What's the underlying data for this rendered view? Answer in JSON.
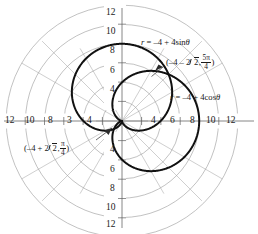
{
  "figure": {
    "kind": "polar-plot",
    "center_px": [
      122,
      121
    ],
    "px_per_unit": 9.65,
    "background": "#ffffff",
    "grid_color": "#9a9a9a",
    "axis_color": "#6e6e6e",
    "curve_color": "#111111"
  },
  "chart_data": {
    "type": "line",
    "plot_system": "polar",
    "title": "",
    "subtitle": "",
    "xlabel": "",
    "ylabel": "",
    "grid": true,
    "legend_position": "inline-annotations",
    "polar_grid": {
      "radial_circles": [
        2,
        4,
        6,
        8,
        10,
        12
      ],
      "spoke_angles_deg": [
        0,
        30,
        45,
        60,
        90,
        120,
        135,
        150,
        180,
        210,
        225,
        240,
        270,
        300,
        315,
        330
      ],
      "rmax": 12
    },
    "axis_ticks": {
      "left": [
        "12",
        "10",
        "8",
        "3",
        "4"
      ],
      "right": [
        "4",
        "6",
        "8",
        "10",
        "12"
      ],
      "top": [
        "12",
        "10",
        "8",
        "6",
        "4"
      ],
      "bottom": [
        "4",
        "6",
        "8",
        "10",
        "12"
      ],
      "left_values": [
        -12,
        -10,
        -8,
        -6,
        -4
      ],
      "right_values": [
        4,
        6,
        8,
        10,
        12
      ],
      "top_values": [
        12,
        10,
        8,
        6,
        4
      ],
      "bottom_values": [
        -4,
        -6,
        -8,
        -10,
        -12
      ]
    },
    "series": [
      {
        "name": "r = -4 + 4sin(theta)",
        "equation_display": "r = –4 + 4sinθ",
        "shape": "cardioid",
        "a": -4,
        "b": 4,
        "trig": "sin",
        "orientation": "opens-upward",
        "max_extent": 8,
        "max_extent_point": [
          0,
          8
        ],
        "passes_through_pole": true
      },
      {
        "name": "r = -4 + 4cos(theta)",
        "equation_display": "r = –4 + 4cosθ",
        "shape": "cardioid",
        "a": -4,
        "b": 4,
        "trig": "cos",
        "orientation": "opens-rightward",
        "max_extent": 8,
        "max_extent_point": [
          8,
          0
        ],
        "passes_through_pole": true
      }
    ],
    "annotations": [
      {
        "id": "eq-sin",
        "text": "r = –4 + 4sinθ",
        "kind": "equation-label",
        "target_series": "r = -4 + 4sin(theta)"
      },
      {
        "id": "eq-cos",
        "text": "r = –4 + 4cosθ",
        "kind": "equation-label",
        "target_series": "r = -4 + 4cos(theta)"
      },
      {
        "id": "pt-upper",
        "kind": "point-label-with-leader",
        "r_display": "–4 – 2√2",
        "theta_num": "5π",
        "theta_den": "4",
        "theta_display": "5π/4",
        "r_value": -6.828,
        "theta_radians": 3.927,
        "cartesian": [
          4.83,
          4.83
        ]
      },
      {
        "id": "pt-lower",
        "kind": "point-label-with-leader",
        "r_display": "–4 + 2√2",
        "theta_num": "π",
        "theta_den": "4",
        "theta_display": "π/4",
        "r_value": -1.172,
        "theta_radians": 0.785,
        "cartesian": [
          -0.83,
          -0.83
        ]
      }
    ]
  },
  "labels": {
    "eq_sin_pre": "r",
    "eq_sin_eq": " = –4 + 4sin",
    "eq_sin_theta": "θ",
    "eq_cos_pre": "r",
    "eq_cos_eq": " = –4 + 4cos",
    "eq_cos_theta": "θ",
    "pt_upper_open": "(–4 – 2",
    "pt_upper_two": "2",
    "pt_upper_comma": ",",
    "pt_upper_num": "5π",
    "pt_upper_den": "4",
    "pt_upper_close": ")",
    "pt_lower_open": "(–4 + 2",
    "pt_lower_two": "2",
    "pt_lower_comma": ",",
    "pt_lower_num": "π",
    "pt_lower_den": "4",
    "pt_lower_close": ")"
  },
  "ticks": {
    "left": [
      "12",
      "10",
      "8",
      "3",
      "4"
    ],
    "right": [
      "4",
      "6",
      "8",
      "10",
      "12"
    ],
    "top": [
      "12",
      "10",
      "8",
      "6",
      "4"
    ],
    "bottom": [
      "4",
      "6",
      "8",
      "10",
      "12"
    ]
  }
}
